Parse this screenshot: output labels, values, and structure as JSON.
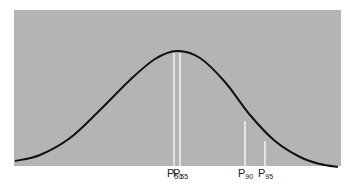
{
  "chart_data": {
    "type": "line",
    "title": "",
    "xlabel": "",
    "ylabel": "",
    "grid": false,
    "legend": null,
    "colors": {
      "panel": "#b4b4b4",
      "curve": "#111111",
      "marker": "#f4f4f4",
      "background": "#ffffff"
    },
    "curve_points": [
      [
        15,
        161
      ],
      [
        40,
        155
      ],
      [
        70,
        138
      ],
      [
        100,
        110
      ],
      [
        130,
        80
      ],
      [
        155,
        59
      ],
      [
        177,
        51
      ],
      [
        200,
        58
      ],
      [
        225,
        82
      ],
      [
        250,
        115
      ],
      [
        275,
        141
      ],
      [
        300,
        157
      ],
      [
        320,
        164
      ],
      [
        338,
        167
      ]
    ],
    "markers": [
      {
        "label": "P",
        "sub": "50",
        "x": 174,
        "y_top": 53
      },
      {
        "label": "P",
        "sub": "55",
        "x": 180,
        "y_top": 53
      },
      {
        "label": "P",
        "sub": "90",
        "x": 245,
        "y_top": 121
      },
      {
        "label": "P",
        "sub": "95",
        "x": 265,
        "y_top": 141
      }
    ]
  }
}
